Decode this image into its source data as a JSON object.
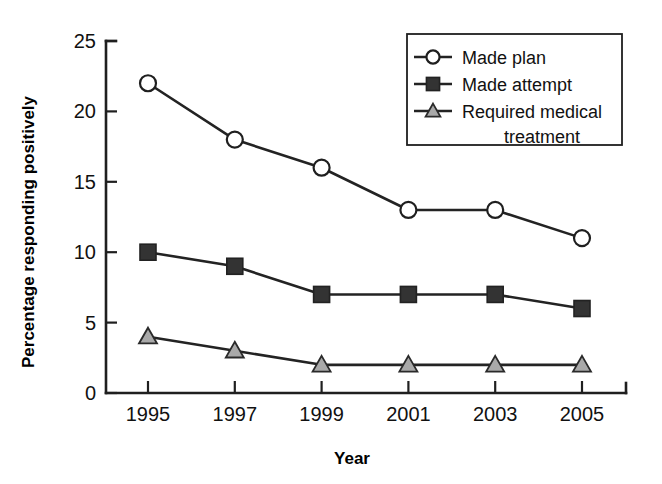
{
  "chart_data": {
    "type": "line",
    "title": "",
    "subtitle": "",
    "xlabel": "Year",
    "ylabel": "Percentage responding positively",
    "categories": [
      "1995",
      "1997",
      "1999",
      "2001",
      "2003",
      "2005"
    ],
    "x": [
      1995,
      1997,
      1999,
      2001,
      2003,
      2005
    ],
    "xlim": [
      1994,
      2006
    ],
    "ylim": [
      0,
      25
    ],
    "yticks": [
      "0",
      "5",
      "10",
      "15",
      "20",
      "25"
    ],
    "ytick_values": [
      0,
      5,
      10,
      15,
      20,
      25
    ],
    "grid": false,
    "legend_position": "top-right",
    "series": [
      {
        "name": "Made plan",
        "marker": "open-circle",
        "color": "#ffffff",
        "line_color": "#232323",
        "values": [
          22,
          18,
          16,
          13,
          13,
          11
        ]
      },
      {
        "name": "Made attempt",
        "marker": "filled-square",
        "color": "#333333",
        "line_color": "#232323",
        "values": [
          10,
          9,
          7,
          7,
          7,
          6
        ]
      },
      {
        "name": "Required medical treatment",
        "marker": "gray-triangle",
        "color": "#a9a9a9",
        "line_color": "#232323",
        "values": [
          4,
          3,
          2,
          2,
          2,
          2
        ]
      }
    ]
  },
  "legend": {
    "entries": [
      {
        "label": "Made plan"
      },
      {
        "label": "Made attempt"
      },
      {
        "label": "Required medical"
      },
      {
        "label": "treatment"
      }
    ]
  },
  "axes": {
    "y_title": "Percentage responding positively",
    "x_title": "Year",
    "y_labels": [
      "25",
      "20",
      "15",
      "10",
      "5",
      "0"
    ],
    "x_labels": [
      "1995",
      "1997",
      "1999",
      "2001",
      "2003",
      "2005"
    ]
  },
  "colors": {
    "axis": "#1f1f1f",
    "line": "#232323",
    "marker_filled": "#333333",
    "marker_triangle": "#a9a9a9",
    "marker_open": "#ffffff",
    "background": "#ffffff"
  }
}
